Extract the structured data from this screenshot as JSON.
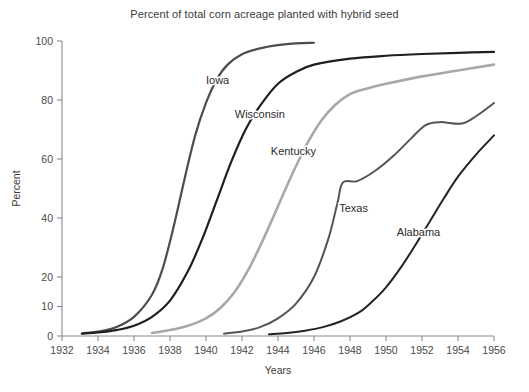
{
  "chart_data": {
    "type": "line",
    "title": "Percent of total corn acreage planted with hybrid seed",
    "xlabel": "Years",
    "ylabel": "Percent",
    "xlim": [
      1932,
      1956
    ],
    "ylim": [
      0,
      100
    ],
    "grid": false,
    "legend_position": "inline-labels",
    "xticks": [
      1932,
      1934,
      1936,
      1938,
      1940,
      1942,
      1944,
      1946,
      1948,
      1950,
      1952,
      1954,
      1956
    ],
    "xtick_labels": [
      "1932",
      "1934",
      "1936",
      "1938",
      "1940",
      "1942",
      "1944",
      "1946",
      "1948",
      "1950",
      "1952",
      "1954",
      "1956"
    ],
    "yticks": [
      0,
      10,
      20,
      40,
      60,
      80,
      100
    ],
    "ytick_labels": [
      "0",
      "10",
      "20",
      "40",
      "60",
      "80",
      "100"
    ],
    "series": [
      {
        "name": "Iowa",
        "color": "#4d4d4d",
        "width": 2.2,
        "label_x": 1940.0,
        "label_y": 85.5,
        "x": [
          1933.2,
          1934.0,
          1935.0,
          1936.0,
          1937.0,
          1937.6,
          1938.2,
          1938.8,
          1939.4,
          1940.0,
          1940.6,
          1941.2,
          1942.0,
          1943.0,
          1944.0,
          1945.0,
          1946.0
        ],
        "values": [
          1.0,
          1.5,
          3.0,
          6.5,
          14.0,
          23.0,
          37.0,
          53.0,
          68.0,
          79.0,
          87.0,
          92.0,
          95.5,
          97.5,
          98.6,
          99.2,
          99.4
        ]
      },
      {
        "name": "Wisconsin",
        "color": "#1f1f1f",
        "width": 2.2,
        "label_x": 1941.6,
        "label_y": 74.0,
        "x": [
          1933.1,
          1934.0,
          1935.0,
          1936.0,
          1937.0,
          1938.0,
          1939.0,
          1939.8,
          1940.6,
          1941.4,
          1942.2,
          1943.0,
          1944.0,
          1945.0,
          1946.0,
          1948.0,
          1950.0,
          1952.0,
          1954.0,
          1956.0
        ],
        "values": [
          0.8,
          1.2,
          2.0,
          3.5,
          6.5,
          12.0,
          22.0,
          33.0,
          46.0,
          59.0,
          70.0,
          78.0,
          85.5,
          89.5,
          92.0,
          94.0,
          95.0,
          95.6,
          96.0,
          96.3
        ]
      },
      {
        "name": "Kentucky",
        "color": "#a8a8a8",
        "width": 2.6,
        "label_x": 1943.6,
        "label_y": 61.5,
        "x": [
          1937.0,
          1938.0,
          1939.0,
          1940.0,
          1940.8,
          1941.6,
          1942.4,
          1943.2,
          1944.0,
          1944.8,
          1945.6,
          1946.4,
          1947.2,
          1948.0,
          1949.0,
          1950.0,
          1952.0,
          1954.0,
          1956.0
        ],
        "values": [
          1.0,
          2.0,
          3.5,
          6.0,
          9.5,
          15.0,
          23.0,
          33.0,
          44.0,
          55.0,
          65.0,
          73.0,
          78.5,
          82.0,
          84.0,
          85.5,
          88.0,
          90.0,
          92.0
        ]
      },
      {
        "name": "Texas",
        "color": "#545454",
        "width": 2.0,
        "label_x": 1947.4,
        "label_y": 42.0,
        "x": [
          1941.0,
          1942.0,
          1943.0,
          1944.0,
          1945.0,
          1946.0,
          1946.8,
          1947.3,
          1947.6,
          1948.4,
          1949.4,
          1950.4,
          1951.4,
          1952.2,
          1953.0,
          1954.2,
          1955.0,
          1956.0
        ],
        "values": [
          0.8,
          1.5,
          3.0,
          6.0,
          11.0,
          20.0,
          33.0,
          45.0,
          52.0,
          52.5,
          56.0,
          61.0,
          67.0,
          71.5,
          72.5,
          72.0,
          74.5,
          79.0
        ]
      },
      {
        "name": "Alabama",
        "color": "#232323",
        "width": 2.0,
        "label_x": 1950.6,
        "label_y": 34.0,
        "x": [
          1943.5,
          1944.5,
          1945.5,
          1946.5,
          1947.5,
          1948.5,
          1949.2,
          1950.0,
          1950.8,
          1951.6,
          1952.4,
          1953.2,
          1954.0,
          1955.0,
          1956.0
        ],
        "values": [
          0.6,
          1.0,
          1.8,
          3.0,
          5.0,
          8.0,
          11.5,
          16.5,
          23.0,
          30.5,
          38.5,
          46.5,
          54.0,
          61.5,
          68.0
        ]
      }
    ]
  }
}
